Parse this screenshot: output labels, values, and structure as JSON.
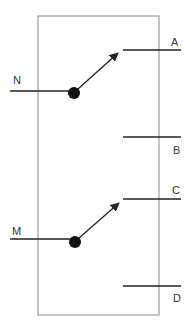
{
  "diagram": {
    "type": "double-switch schematic",
    "colors": {
      "box": "#888888",
      "line": "#222222",
      "dot": "#111111",
      "label": "#333333"
    },
    "box": {
      "x": 38,
      "y": 16,
      "w": 121,
      "h": 299
    },
    "switches": [
      {
        "id": "upper",
        "input": {
          "label": "N",
          "label_x": 13,
          "label_y": 84,
          "y": 91,
          "x1": 10,
          "x2": 74
        },
        "pivot": {
          "cx": 74,
          "cy": 93,
          "r": 6
        },
        "arm": {
          "x1": 78,
          "y1": 89,
          "x2": 118,
          "y2": 53
        },
        "outputs": [
          {
            "label": "A",
            "y": 50,
            "x1": 123,
            "x2": 181,
            "label_x": 171,
            "label_y": 46
          },
          {
            "label": "B",
            "y": 137,
            "x1": 123,
            "x2": 181,
            "label_x": 173,
            "label_y": 154
          }
        ]
      },
      {
        "id": "lower",
        "input": {
          "label": "M",
          "label_x": 12,
          "label_y": 235,
          "y": 239,
          "x1": 10,
          "x2": 75
        },
        "pivot": {
          "cx": 75,
          "cy": 242,
          "r": 6
        },
        "arm": {
          "x1": 79,
          "y1": 238,
          "x2": 119,
          "y2": 203
        },
        "outputs": [
          {
            "label": "C",
            "y": 199,
            "x1": 123,
            "x2": 181,
            "label_x": 172,
            "label_y": 194
          },
          {
            "label": "D",
            "y": 286,
            "x1": 123,
            "x2": 181,
            "label_x": 173,
            "label_y": 302
          }
        ]
      }
    ]
  }
}
